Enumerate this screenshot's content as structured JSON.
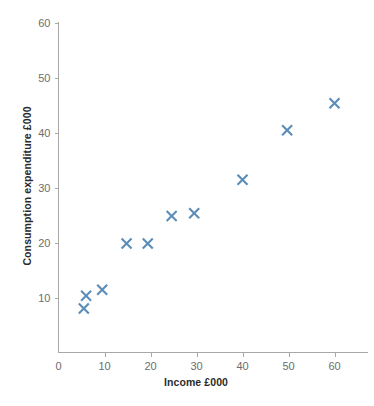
{
  "chart_data": {
    "type": "scatter",
    "title": "",
    "xlabel": "Income £000",
    "ylabel": "Consumption expenditure £000",
    "xlim": [
      0,
      65
    ],
    "ylim": [
      0,
      62
    ],
    "xticks": [
      0,
      10,
      20,
      30,
      40,
      50,
      60
    ],
    "xtick_labels": [
      "0",
      "10",
      "20",
      "30",
      "40",
      "50",
      "60"
    ],
    "yticks": [
      10,
      20,
      30,
      40,
      50,
      60
    ],
    "ytick_labels": [
      "10",
      "20",
      "30",
      "40",
      "50",
      "60"
    ],
    "grid": false,
    "legend": "none",
    "marker": "x",
    "marker_color": "#5b8db8",
    "points": [
      {
        "x": 5.5,
        "y": 8.0
      },
      {
        "x": 6.0,
        "y": 10.3
      },
      {
        "x": 9.5,
        "y": 11.4
      },
      {
        "x": 14.8,
        "y": 19.8
      },
      {
        "x": 19.4,
        "y": 19.8
      },
      {
        "x": 24.6,
        "y": 24.8
      },
      {
        "x": 29.5,
        "y": 25.3
      },
      {
        "x": 40.0,
        "y": 31.4
      },
      {
        "x": 49.7,
        "y": 40.4
      },
      {
        "x": 60.0,
        "y": 45.3
      }
    ]
  },
  "axes": {
    "x_title": "Income £000",
    "y_title": "Consumption expenditure £000"
  }
}
